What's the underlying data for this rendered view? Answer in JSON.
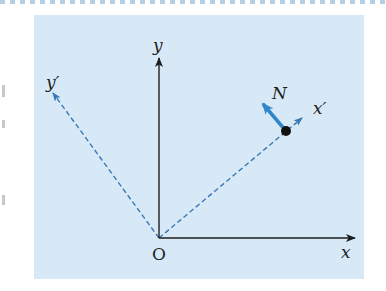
{
  "diagram": {
    "type": "rotated-coordinate-frame",
    "colors": {
      "panel_background": "#d7e9f6",
      "axis_color": "#1e1e1e",
      "rotated_axis_color": "#3a78b5",
      "vector_color": "#2f86c8",
      "point_color": "#111111"
    },
    "labels": {
      "origin": "O",
      "x_axis": "x",
      "y_axis": "y",
      "x_prime_axis": "x′",
      "y_prime_axis": "y′",
      "vector": "N"
    },
    "elements": {
      "origin_px": [
        159,
        238
      ],
      "x_axis_end_px": [
        355,
        238
      ],
      "y_axis_end_px": [
        159,
        58
      ],
      "x_prime_end_px": [
        302,
        118
      ],
      "y_prime_end_px": [
        53,
        93
      ],
      "point_px": [
        286,
        131
      ],
      "vector_tip_px": [
        263,
        104
      ]
    }
  }
}
